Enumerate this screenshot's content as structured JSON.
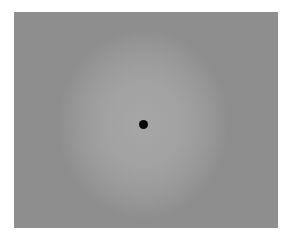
{
  "image": {
    "description": "Uniform gray field with a soft lighter circular glow and a small black dot at its center",
    "colors": {
      "background": "#ffffff",
      "field": "#8e8e8e",
      "glow": "#a6a6a6",
      "dot": "#0a0a0a"
    },
    "field_bounds": {
      "left": 14,
      "top": 12,
      "width": 264,
      "height": 216
    },
    "dot": {
      "center_x": 143,
      "center_y": 124,
      "diameter": 9
    }
  }
}
